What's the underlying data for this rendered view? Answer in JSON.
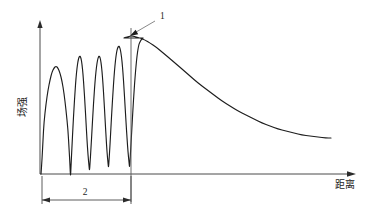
{
  "figure": {
    "title": "",
    "background_color": "#ffffff",
    "curve_color": "#1d1d1d",
    "axis_color": "#4a4a4a"
  },
  "axes": {
    "y_label": "场强",
    "x_label": "距离",
    "origin": {
      "x": 40,
      "y": 174
    },
    "y_axis_top": {
      "x": 40,
      "y": 20
    },
    "x_axis_right": {
      "x": 356,
      "y": 174
    },
    "y_label_position": {
      "x": 26,
      "y": 107
    },
    "x_label_position": {
      "x": 345,
      "y": 188
    }
  },
  "annotations": [
    {
      "name": "peak-callout",
      "label": "1",
      "label_x": 160,
      "label_y": 19,
      "leader_from": {
        "x": 155,
        "y": 21
      },
      "leader_to": {
        "x": 131,
        "y": 35
      },
      "target_point": {
        "x": 130,
        "y": 36
      }
    },
    {
      "name": "span-dimension",
      "label": "2",
      "label_x": 85,
      "label_y": 195,
      "from_x": 42,
      "to_x": 131,
      "line_y": 200
    }
  ],
  "marker_line": {
    "name": "peak-vertical-marker",
    "x": 131,
    "y_top": 28,
    "y_bottom": 202
  },
  "chart_data": {
    "type": "line",
    "title": "",
    "xlabel": "距离",
    "ylabel": "场强",
    "grid": false,
    "legend": null,
    "xlim": [
      0,
      356
    ],
    "ylim": [
      0,
      174
    ],
    "annotations": [
      {
        "label": "1",
        "meaning": "最大场强点 / 断点",
        "x": 130,
        "y": 36
      },
      {
        "label": "2",
        "meaning": "振荡衰落区间",
        "x_from": 42,
        "x_to": 131
      }
    ],
    "series": [
      {
        "name": "field-strength",
        "points": [
          [
            41,
            174
          ],
          [
            42,
            160
          ],
          [
            43,
            140
          ],
          [
            44,
            122
          ],
          [
            46,
            104
          ],
          [
            48,
            90
          ],
          [
            50,
            80
          ],
          [
            52,
            72
          ],
          [
            54,
            68
          ],
          [
            56,
            66
          ],
          [
            58,
            68
          ],
          [
            60,
            73
          ],
          [
            62,
            81
          ],
          [
            64,
            93
          ],
          [
            66,
            110
          ],
          [
            68,
            130
          ],
          [
            69,
            148
          ],
          [
            70,
            165
          ],
          [
            70.5,
            178
          ],
          [
            71,
            166
          ],
          [
            72,
            146
          ],
          [
            73,
            126
          ],
          [
            74,
            108
          ],
          [
            75,
            92
          ],
          [
            76,
            78
          ],
          [
            77,
            68
          ],
          [
            78,
            61
          ],
          [
            79,
            57
          ],
          [
            80,
            56
          ],
          [
            81,
            58
          ],
          [
            82,
            64
          ],
          [
            83,
            74
          ],
          [
            84,
            88
          ],
          [
            85,
            104
          ],
          [
            86,
            122
          ],
          [
            87,
            140
          ],
          [
            88,
            155
          ],
          [
            89,
            166
          ],
          [
            89.5,
            171
          ],
          [
            90,
            164
          ],
          [
            91,
            148
          ],
          [
            92,
            130
          ],
          [
            93,
            112
          ],
          [
            94,
            96
          ],
          [
            95,
            82
          ],
          [
            96,
            71
          ],
          [
            97,
            63
          ],
          [
            98,
            58
          ],
          [
            99,
            56
          ],
          [
            100,
            57
          ],
          [
            101,
            62
          ],
          [
            102,
            71
          ],
          [
            103,
            84
          ],
          [
            104,
            100
          ],
          [
            105,
            118
          ],
          [
            106,
            136
          ],
          [
            107,
            152
          ],
          [
            108,
            163
          ],
          [
            108.5,
            168
          ],
          [
            109,
            161
          ],
          [
            110,
            145
          ],
          [
            111,
            126
          ],
          [
            112,
            108
          ],
          [
            113,
            92
          ],
          [
            114,
            77
          ],
          [
            115,
            65
          ],
          [
            116,
            56
          ],
          [
            117,
            50
          ],
          [
            118,
            47
          ],
          [
            119,
            46
          ],
          [
            120,
            48
          ],
          [
            121,
            53
          ],
          [
            122,
            61
          ],
          [
            123,
            73
          ],
          [
            124,
            88
          ],
          [
            125,
            105
          ],
          [
            126,
            122
          ],
          [
            127,
            138
          ],
          [
            128,
            152
          ],
          [
            129,
            162
          ],
          [
            129.6,
            168
          ],
          [
            130,
            161
          ],
          [
            131,
            144
          ],
          [
            132,
            126
          ],
          [
            133,
            108
          ],
          [
            134,
            92
          ],
          [
            135,
            78
          ],
          [
            136,
            66
          ],
          [
            137,
            56
          ],
          [
            138,
            49
          ],
          [
            139,
            44
          ],
          [
            140,
            42
          ],
          [
            141,
            40
          ],
          [
            142,
            39
          ],
          [
            143,
            38
          ],
          [
            124,
            38
          ],
          [
            126,
            37
          ],
          [
            128,
            37
          ],
          [
            130,
            36
          ],
          [
            133,
            36
          ],
          [
            136,
            37
          ],
          [
            140,
            38
          ],
          [
            145,
            40
          ],
          [
            150,
            43
          ],
          [
            156,
            47
          ],
          [
            162,
            52
          ],
          [
            168,
            57
          ],
          [
            175,
            63
          ],
          [
            182,
            69
          ],
          [
            190,
            76
          ],
          [
            198,
            83
          ],
          [
            206,
            89
          ],
          [
            214,
            95
          ],
          [
            222,
            101
          ],
          [
            230,
            106
          ],
          [
            238,
            111
          ],
          [
            246,
            115
          ],
          [
            254,
            119
          ],
          [
            262,
            123
          ],
          [
            270,
            126
          ],
          [
            278,
            129
          ],
          [
            286,
            131
          ],
          [
            294,
            133
          ],
          [
            302,
            135
          ],
          [
            310,
            136
          ],
          [
            318,
            137
          ],
          [
            326,
            138
          ],
          [
            331,
            138
          ]
        ]
      }
    ]
  }
}
